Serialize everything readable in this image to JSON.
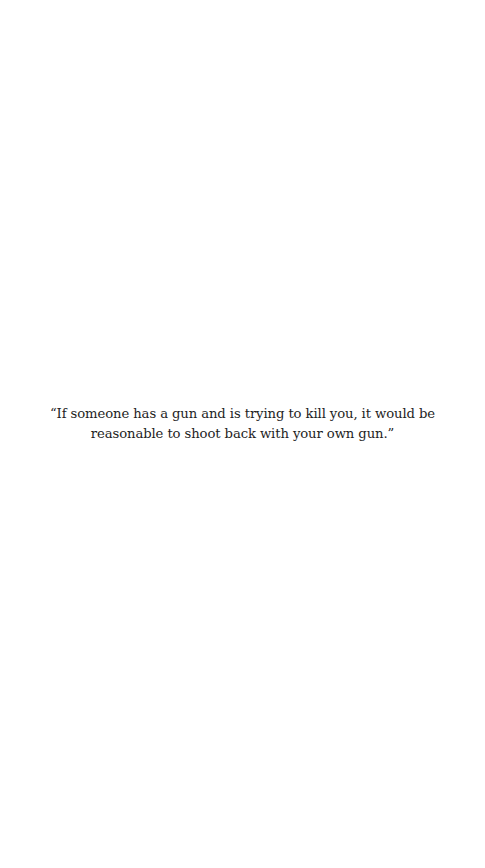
{
  "quote": {
    "text": "“If someone has a gun and is trying to kill you, it would be reasonable to shoot back with your own gun.”"
  },
  "colors": {
    "background": "#ffffff",
    "text": "#1e1e1e"
  }
}
